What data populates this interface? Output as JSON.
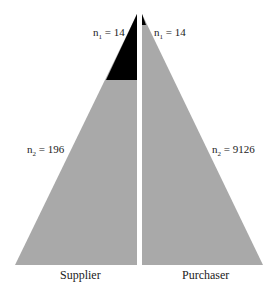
{
  "diagram": {
    "left": {
      "label": "Supplier",
      "n1_label": "n",
      "n1_sub": "1",
      "n1_value": " = 14",
      "n2_label": "n",
      "n2_sub": "2",
      "n2_value": " = 196"
    },
    "right": {
      "label": "Purchaser",
      "n1_label": "n",
      "n1_sub": "1",
      "n1_value": " = 14",
      "n2_label": "n",
      "n2_sub": "2",
      "n2_value": " = 9126"
    },
    "colors": {
      "fill": "#a9a9a9",
      "highlight": "#000000"
    }
  }
}
